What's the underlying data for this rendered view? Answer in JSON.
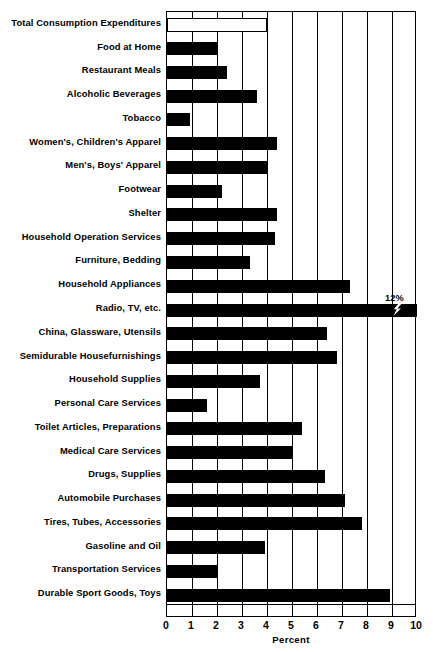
{
  "chart_data": {
    "type": "bar",
    "orientation": "horizontal",
    "title": "",
    "xlabel": "Percent",
    "ylabel": "",
    "xlim": [
      0,
      10
    ],
    "xticks": [
      "0",
      "1",
      "2",
      "3",
      "4",
      "5",
      "6",
      "7",
      "8",
      "9",
      "10"
    ],
    "grid": true,
    "legend": null,
    "categories": [
      "Total Consumption Expenditures",
      "Food at Home",
      "Restaurant Meals",
      "Alcoholic Beverages",
      "Tobacco",
      "Women's, Children's Apparel",
      "Men's, Boys' Apparel",
      "Footwear",
      "Shelter",
      "Household Operation Services",
      "Furniture, Bedding",
      "Household Appliances",
      "Radio, TV, etc.",
      "China, Glassware, Utensils",
      "Semidurable Housefurnishings",
      "Household Supplies",
      "Personal Care Services",
      "Toilet Articles, Preparations",
      "Medical Care Services",
      "Drugs, Supplies",
      "Automobile Purchases",
      "Tires, Tubes, Accessories",
      "Gasoline and Oil",
      "Transportation Services",
      "Durable Sport Goods, Toys"
    ],
    "values": [
      4.0,
      2.0,
      2.4,
      3.6,
      0.9,
      4.4,
      4.0,
      2.2,
      4.4,
      4.3,
      3.3,
      7.3,
      12.0,
      6.4,
      6.8,
      3.7,
      1.6,
      5.4,
      5.0,
      6.3,
      7.1,
      7.8,
      3.9,
      2.0,
      8.9
    ],
    "styles": [
      "hollow",
      "solid",
      "solid",
      "solid",
      "solid",
      "solid",
      "solid",
      "solid",
      "solid",
      "solid",
      "solid",
      "solid",
      "solid-broken",
      "solid",
      "solid",
      "solid",
      "solid",
      "solid",
      "solid",
      "solid",
      "solid",
      "solid",
      "solid",
      "solid",
      "solid"
    ],
    "annotations": [
      {
        "series_index": 12,
        "text": "12%",
        "note": "bar exceeds axis; axis-break zigzag drawn in bar"
      }
    ],
    "colors": {
      "bar": "#000000",
      "hollow_bar_fill": "#ffffff",
      "axis": "#000000",
      "background": "#ffffff"
    }
  }
}
